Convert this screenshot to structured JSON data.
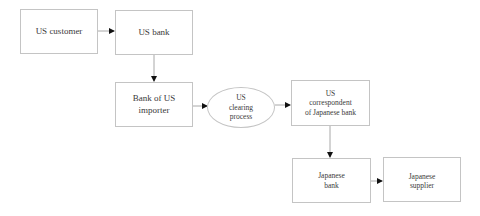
{
  "diagram": {
    "nodes": {
      "us_customer": {
        "label": "US customer",
        "shape": "rect"
      },
      "us_bank": {
        "label": "US bank",
        "shape": "rect"
      },
      "bank_of_us_importer": {
        "label": "Bank of US\nimporter",
        "shape": "rect"
      },
      "us_clearing_process": {
        "label": "US\nclearing\nprocess",
        "shape": "ellipse"
      },
      "us_correspondent": {
        "label": "US\ncorrespondent\nof Japanese bank",
        "shape": "rect"
      },
      "japanese_bank": {
        "label": "Japanese\nbank",
        "shape": "rect"
      },
      "japanese_supplier": {
        "label": "Japanese\nsupplier",
        "shape": "rect"
      }
    },
    "edges": [
      {
        "from": "US customer",
        "to": "US bank"
      },
      {
        "from": "US bank",
        "to": "Bank of US importer"
      },
      {
        "from": "Bank of US importer",
        "to": "US clearing process"
      },
      {
        "from": "US clearing process",
        "to": "US correspondent of Japanese bank"
      },
      {
        "from": "US correspondent of Japanese bank",
        "to": "Japanese bank"
      },
      {
        "from": "Japanese bank",
        "to": "Japanese supplier"
      }
    ],
    "colors": {
      "border": "#c4c4c4",
      "line": "#a8a8a8",
      "arrowhead": "#111111",
      "text": "#3a3a3a"
    }
  }
}
